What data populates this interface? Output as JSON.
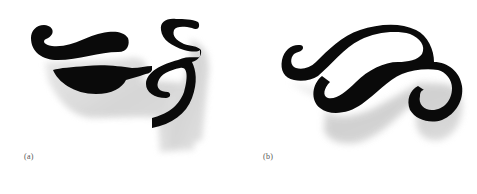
{
  "figures": [
    {
      "id": "a",
      "label": "(a)",
      "description": "black calligraphic ornament with gray drop shadow: curl, teardrop lobe, leaf and S-hook"
    },
    {
      "id": "b",
      "label": "(b)",
      "description": "black calligraphic swash loop with gray drop shadow"
    }
  ],
  "colors": {
    "shape_fill": "#0a0a0a",
    "shadow": "#c8c8c8",
    "label_text": "#555555",
    "background": "#ffffff"
  }
}
